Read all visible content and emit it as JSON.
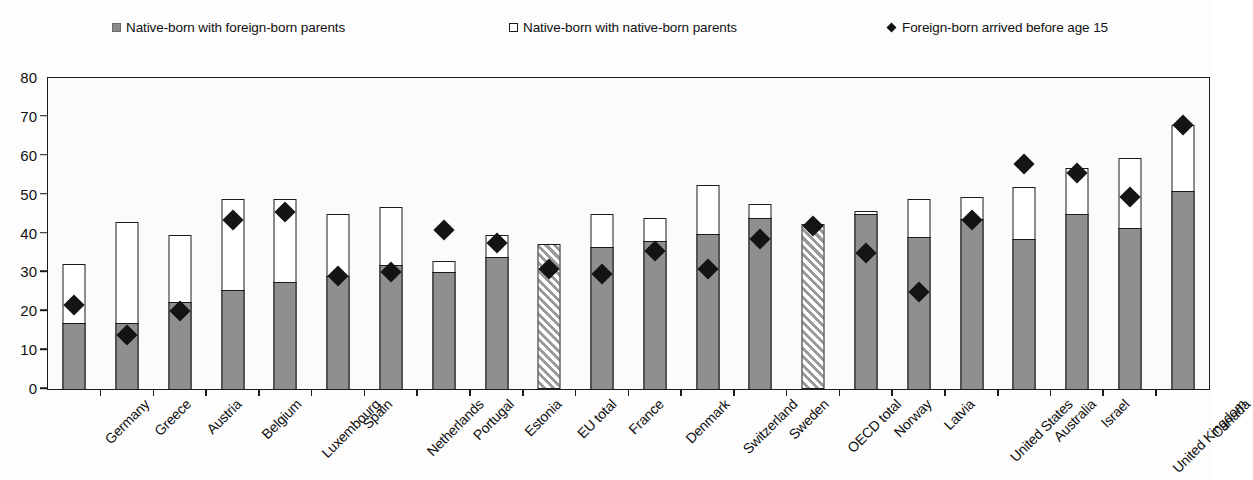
{
  "legend": {
    "items": [
      {
        "label": "Native-born with foreign-born parents",
        "icon": "filled-square-icon",
        "color": "#8a8a8a",
        "left": 112
      },
      {
        "label": "Native-born with native-born parents",
        "icon": "hollow-square-icon",
        "color": "#ffffff",
        "left": 509
      },
      {
        "label": "Foreign-born arrived before age 15",
        "icon": "diamond-marker-icon",
        "color": "#111111",
        "left": 887
      }
    ]
  },
  "chart_data": {
    "type": "bar",
    "title": "",
    "subtitle": "",
    "xlabel": "",
    "ylabel": "",
    "ylim": [
      0,
      80
    ],
    "yticks": [
      0,
      10,
      20,
      30,
      40,
      50,
      60,
      70,
      80
    ],
    "ytick_labels": [
      "0",
      "10",
      "20",
      "30",
      "40",
      "50",
      "60",
      "70",
      "80"
    ],
    "grid": false,
    "legend_position": "top",
    "stacked": true,
    "categories": [
      "Germany",
      "Greece",
      "Austria",
      "Belgium",
      "Luxembourg",
      "Spain",
      "Netherlands",
      "Portugal",
      "Estonia",
      "EU total",
      "France",
      "Denmark",
      "Switzerland",
      "Sweden",
      "OECD total",
      "Norway",
      "Latvia",
      "United States",
      "Australia",
      "Israel",
      "United Kingdom",
      "Canada"
    ],
    "aggregate_categories": [
      "EU total",
      "OECD total"
    ],
    "series": [
      {
        "name": "Native-born with foreign-born parents",
        "style": "filled",
        "color": "#8f8f8f",
        "values": [
          17.0,
          17.0,
          22.5,
          25.5,
          27.5,
          29.0,
          32.0,
          30.0,
          34.0,
          37.3,
          36.5,
          38.0,
          40.0,
          44.0,
          42.5,
          45.0,
          39.0,
          43.8,
          38.5,
          45.0,
          41.3,
          51.0
        ]
      },
      {
        "name": "Native-born with native-born parents",
        "style": "hollow",
        "color": "#ffffff",
        "values": [
          15.2,
          26.0,
          17.0,
          23.5,
          21.5,
          16.0,
          14.8,
          3.0,
          5.5,
          0.0,
          8.5,
          6.0,
          12.5,
          3.5,
          0.0,
          0.8,
          9.8,
          5.5,
          13.5,
          11.8,
          18.2,
          17.0
        ]
      }
    ],
    "totals": [
      32.2,
      43.0,
      39.5,
      49.0,
      49.0,
      45.0,
      46.8,
      33.0,
      39.5,
      37.3,
      45.0,
      44.0,
      52.5,
      47.5,
      42.5,
      45.8,
      48.8,
      49.3,
      52.0,
      56.8,
      59.5,
      68.0
    ],
    "markers": {
      "name": "Foreign-born arrived before age 15",
      "style": "diamond",
      "color": "#141414",
      "values": [
        21.5,
        14.0,
        20.0,
        43.5,
        45.5,
        29.0,
        30.0,
        41.0,
        37.5,
        31.0,
        29.5,
        35.5,
        31.0,
        38.5,
        42.0,
        35.0,
        25.0,
        43.5,
        58.0,
        55.5,
        49.3,
        68.0
      ]
    }
  }
}
